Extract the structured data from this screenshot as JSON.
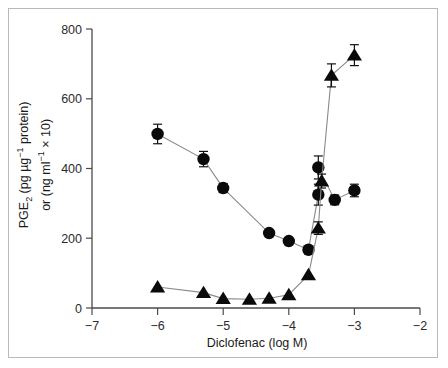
{
  "figure": {
    "background_color": "#ffffff",
    "frame_color": "#b9b9b9",
    "marker_color": "#0a0a0a",
    "line_color": "#8a8a8a"
  },
  "axes": {
    "y_label_line1_prefix": "PGE",
    "y_label_line1_sub": "2",
    "y_label_line1_rest": " (pg µg",
    "y_label_line1_sup": "−1",
    "y_label_line1_tail": " protein)",
    "y_label_line2_prefix": "or (ng ml",
    "y_label_line2_sup": "−1",
    "y_label_line2_tail": " × 10)",
    "x_label": "Diclofenac (log M)",
    "y_ticks": [
      "0",
      "200",
      "400",
      "600",
      "800"
    ],
    "x_ticks": [
      "−7",
      "−6",
      "−5",
      "−4",
      "−3",
      "−2"
    ]
  },
  "chart_data": {
    "type": "scatter",
    "title": "",
    "xlabel": "Diclofenac (log M)",
    "ylabel": "PGE2 (pg µg−1 protein) or (ng ml−1 × 10)",
    "xlim": [
      -7,
      -2
    ],
    "ylim": [
      0,
      800
    ],
    "grid": false,
    "legend": "none",
    "x_tick_values": [
      -7,
      -6,
      -5,
      -4,
      -3,
      -2
    ],
    "y_tick_values": [
      0,
      200,
      400,
      600,
      800
    ],
    "series": [
      {
        "name": "PGE2 (circles)",
        "marker": "circle",
        "x": [
          -6.0,
          -5.3,
          -5.0,
          -4.3,
          -4.0,
          -3.7,
          -3.55,
          -3.55,
          -3.3,
          -3.0
        ],
        "values": [
          499,
          427,
          344,
          215,
          192,
          167,
          325,
          403,
          310,
          337
        ],
        "errors": [
          28,
          22,
          13,
          0,
          0,
          0,
          30,
          33,
          14,
          18
        ]
      },
      {
        "name": "LDH (triangles)",
        "marker": "triangle",
        "x": [
          -6.0,
          -5.3,
          -5.0,
          -4.6,
          -4.3,
          -4.0,
          -3.7,
          -3.55,
          -3.5,
          -3.35,
          -3.0
        ],
        "values": [
          60,
          44,
          27,
          25,
          28,
          38,
          95,
          229,
          364,
          667,
          725
        ],
        "errors": [
          0,
          0,
          0,
          0,
          0,
          0,
          0,
          18,
          20,
          33,
          30
        ]
      }
    ]
  }
}
